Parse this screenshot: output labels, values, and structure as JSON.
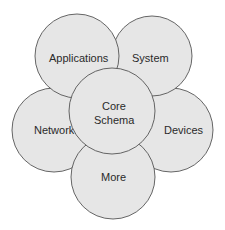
{
  "diagram": {
    "type": "overlapping-circles",
    "colors": {
      "fill": "#e6e6e6",
      "stroke": "#555555",
      "text": "#2a2a2a",
      "background": "#ffffff"
    },
    "circles": [
      {
        "id": "network",
        "label": "Network",
        "cx": 54,
        "cy": 130,
        "r": 42
      },
      {
        "id": "devices",
        "label": "Devices",
        "cx": 171,
        "cy": 130,
        "r": 42
      },
      {
        "id": "system",
        "label": "System",
        "cx": 152,
        "cy": 56,
        "r": 40
      },
      {
        "id": "applications",
        "label": "Applications",
        "cx": 77,
        "cy": 56,
        "r": 42
      },
      {
        "id": "more",
        "label": "More",
        "cx": 113,
        "cy": 177,
        "r": 42
      },
      {
        "id": "core",
        "label_line1": "Core",
        "label_line2": "Schema",
        "cx": 112,
        "cy": 111,
        "r": 43
      }
    ]
  }
}
